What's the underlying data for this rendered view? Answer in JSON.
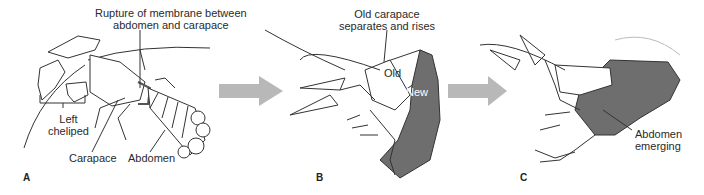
{
  "figure": {
    "panels": [
      {
        "letter": "A",
        "labels": {
          "rupture": "Rupture of membrane between",
          "rupture2": "abdomen and carapace",
          "cheliped": "Left",
          "cheliped2": "cheliped",
          "carapace": "Carapace",
          "abdomen": "Abdomen"
        }
      },
      {
        "letter": "B",
        "labels": {
          "old_carapace": "Old carapace",
          "old_carapace2": "separates and rises",
          "old": "Old",
          "new": "New"
        }
      },
      {
        "letter": "C",
        "labels": {
          "abdomen_emerging": "Abdomen",
          "abdomen_emerging2": "emerging"
        }
      }
    ],
    "arrows": [
      {
        "from": "A",
        "to": "B"
      },
      {
        "from": "B",
        "to": "C"
      }
    ],
    "colors": {
      "arrow": "#b5b5b5",
      "new_shell": "#6e6e6e",
      "line": "#333333"
    }
  }
}
